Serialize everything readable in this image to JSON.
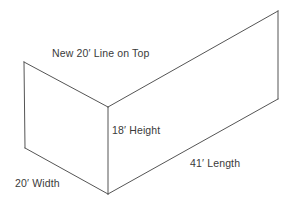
{
  "diagram": {
    "title": "",
    "type": "3d-wireframe-box-corner",
    "stroke_color": "#555555",
    "background_color": "#ffffff",
    "text_color": "#3a3a3a",
    "stroke_width": 1,
    "labels": {
      "top_line": "New 20′ Line on Top",
      "height": "18′ Height",
      "length": "41′ Length",
      "width": "20′ Width"
    },
    "measurements": [
      {
        "name": "top-line",
        "value": "20",
        "unit": "′",
        "text": "New 20′ Line on Top"
      },
      {
        "name": "height",
        "value": "18",
        "unit": "′",
        "text": "18′ Height"
      },
      {
        "name": "length",
        "value": "41",
        "unit": "′",
        "text": "41′ Length"
      },
      {
        "name": "width",
        "value": "20",
        "unit": "′",
        "text": "20′ Width"
      }
    ],
    "vertices": {
      "top_left": [
        24,
        62
      ],
      "bottom_left": [
        25,
        148
      ],
      "center_top": [
        108,
        107
      ],
      "center_bottom": [
        108,
        194
      ],
      "top_right": [
        278,
        11
      ],
      "bottom_right": [
        278,
        99
      ]
    },
    "edges": [
      {
        "name": "left-front-vertical",
        "from": "top_left",
        "to": "bottom_left"
      },
      {
        "name": "left-top-diagonal",
        "from": "top_left",
        "to": "center_top"
      },
      {
        "name": "left-bottom-diagonal",
        "from": "bottom_left",
        "to": "center_bottom"
      },
      {
        "name": "center-vertical-height",
        "from": "center_top",
        "to": "center_bottom"
      },
      {
        "name": "right-top-diagonal",
        "from": "center_top",
        "to": "top_right"
      },
      {
        "name": "right-bottom-diagonal",
        "from": "center_bottom",
        "to": "bottom_right"
      },
      {
        "name": "right-back-vertical",
        "from": "top_right",
        "to": "bottom_right"
      }
    ]
  }
}
